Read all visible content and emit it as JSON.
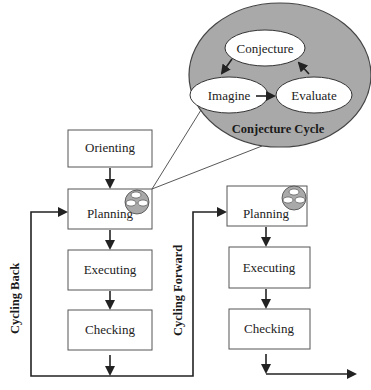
{
  "colors": {
    "cycle_fill": "#a9a9a9",
    "cycle_stroke": "#444444",
    "node_fill": "#ffffff",
    "box_stroke": "#555555",
    "line": "#222222"
  },
  "conjecture_cycle": {
    "title": "Conjecture Cycle",
    "nodes": [
      "Conjecture",
      "Imagine",
      "Evaluate"
    ],
    "edges": [
      {
        "from": "Conjecture",
        "to": "Imagine"
      },
      {
        "from": "Imagine",
        "to": "Evaluate"
      },
      {
        "from": "Evaluate",
        "to": "Conjecture"
      }
    ]
  },
  "left_column": {
    "boxes": [
      "Orienting",
      "Planning",
      "Executing",
      "Checking"
    ]
  },
  "right_column": {
    "boxes": [
      "Planning",
      "Executing",
      "Checking"
    ]
  },
  "loops": {
    "back_label": "Cycling Back",
    "forward_label": "Cycling Forward"
  }
}
